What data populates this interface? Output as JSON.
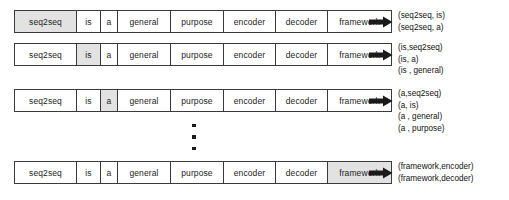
{
  "diagram": {
    "sentence_tokens": [
      "seq2seq",
      "is",
      "a",
      "general",
      "purpose",
      "encoder",
      "decoder",
      "framework"
    ],
    "arrow_icon": "right-arrow-icon",
    "ellipsis_icon": "vertical-ellipsis-icon",
    "rows": [
      {
        "focus_index": 0,
        "tokens": [
          "seq2seq",
          "is",
          "a",
          "general",
          "purpose",
          "encoder",
          "decoder",
          "framework"
        ],
        "pairs": [
          "(seq2seq, is)",
          "(seq2seq, a)"
        ]
      },
      {
        "focus_index": 1,
        "tokens": [
          "seq2seq",
          "is",
          "a",
          "general",
          "purpose",
          "encoder",
          "decoder",
          "framework"
        ],
        "pairs": [
          "(is,seq2seq)",
          "(is, a)",
          "(is , general)"
        ]
      },
      {
        "focus_index": 2,
        "tokens": [
          "seq2seq",
          "is",
          "a",
          "general",
          "purpose",
          "encoder",
          "decoder",
          "framework"
        ],
        "pairs": [
          "(a,seq2seq)",
          "(a, is)",
          "(a , general)",
          "(a , purpose)"
        ]
      },
      {
        "focus_index": 7,
        "tokens": [
          "seq2seq",
          "is",
          "a",
          "general",
          "purpose",
          "encoder",
          "decoder",
          "framework"
        ],
        "pairs": [
          "(framework,encoder)",
          "(framework,decoder)"
        ]
      }
    ],
    "colors": {
      "border": "#3a3a3a",
      "highlight": "#e2e2e2",
      "text": "#1c1c1c",
      "arrow": "#1a1a1a",
      "background": "#ffffff"
    }
  }
}
